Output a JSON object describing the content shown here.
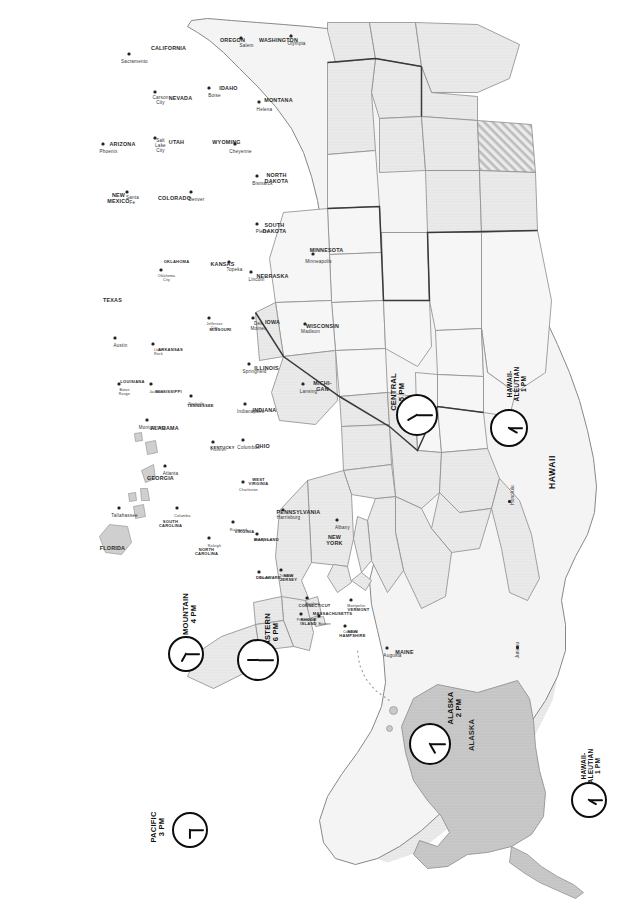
{
  "map": {
    "title": "United States Time Zone Map",
    "orientation": "rotated-90-clockwise",
    "background_color": "#ffffff",
    "zone_fill_color": "#e9e9e9",
    "no_dst_fill": "diagonal-hatch",
    "border_color": "#6b6b6b",
    "zone_divider_color": "#2f2f2f"
  },
  "zones": [
    {
      "name": "EASTERN",
      "time": "6 PM",
      "label": "EASTERN\n6 PM",
      "clock": "6:00"
    },
    {
      "name": "CENTRAL",
      "time": "5 PM",
      "label": "CENTRAL\n5 PM",
      "clock": "5:00"
    },
    {
      "name": "MOUNTAIN",
      "time": "4 PM",
      "label": "MOUNTAIN\n4 PM",
      "clock": "4:00"
    },
    {
      "name": "PACIFIC",
      "time": "3 PM",
      "label": "PACIFIC\n3 PM",
      "clock": "3:00"
    },
    {
      "name": "ALASKA",
      "time": "2 PM",
      "label": "ALASKA\n2 PM",
      "clock": "2:00"
    },
    {
      "name": "HAWAII-ALEUTIAN",
      "time": "1 PM",
      "label": "HAWAII-\nALEUTIAN\n1 PM",
      "clock": "1:00"
    },
    {
      "name": "HAWAII-ALEUTIAN",
      "time": "1 PM",
      "label": "HAWAII-\nALEUTIAN\n1 PM",
      "clock": "1:00"
    }
  ],
  "states": [
    {
      "name": "MAINE",
      "capital": "Augusta"
    },
    {
      "name": "NEW HAMPSHIRE",
      "capital": "Concord"
    },
    {
      "name": "VERMONT",
      "capital": "Montpelier"
    },
    {
      "name": "MASSACHUSETTS",
      "capital": "Boston"
    },
    {
      "name": "RHODE ISLAND",
      "capital": "Providence"
    },
    {
      "name": "CONNECTICUT",
      "capital": "Hartford"
    },
    {
      "name": "NEW YORK",
      "capital": "Albany"
    },
    {
      "name": "NEW JERSEY",
      "capital": "Trenton"
    },
    {
      "name": "PENNSYLVANIA",
      "capital": "Harrisburg"
    },
    {
      "name": "DELAWARE",
      "capital": "Dover"
    },
    {
      "name": "MARYLAND",
      "capital": "Annapolis"
    },
    {
      "name": "WEST VIRGINIA",
      "capital": "Charleston"
    },
    {
      "name": "VIRGINIA",
      "capital": "Richmond"
    },
    {
      "name": "NORTH CAROLINA",
      "capital": "Raleigh"
    },
    {
      "name": "SOUTH CAROLINA",
      "capital": "Columbia"
    },
    {
      "name": "GEORGIA",
      "capital": "Atlanta"
    },
    {
      "name": "FLORIDA",
      "capital": "Tallahassee"
    },
    {
      "name": "OHIO",
      "capital": "Columbus"
    },
    {
      "name": "KENTUCKY",
      "capital": "Frankfort"
    },
    {
      "name": "TENNESSEE",
      "capital": "Nashville"
    },
    {
      "name": "ALABAMA",
      "capital": "Montgomery"
    },
    {
      "name": "MISSISSIPPI",
      "capital": "Jackson"
    },
    {
      "name": "LOUISIANA",
      "capital": "Baton Rouge"
    },
    {
      "name": "ARKANSAS",
      "capital": "Little Rock"
    },
    {
      "name": "MISSOURI",
      "capital": "Jefferson City"
    },
    {
      "name": "ILLINOIS",
      "capital": "Springfield"
    },
    {
      "name": "INDIANA",
      "capital": "Indianapolis"
    },
    {
      "name": "MICHI-GAN",
      "capital": "Lansing"
    },
    {
      "name": "WISCONSIN",
      "capital": "Madison"
    },
    {
      "name": "MINNESOTA",
      "capital": "Minneapolis"
    },
    {
      "name": "IOWA",
      "capital": "Des Moines"
    },
    {
      "name": "NORTH DAKOTA",
      "capital": "Bismarck"
    },
    {
      "name": "SOUTH DAKOTA",
      "capital": "Pierre"
    },
    {
      "name": "NEBRASKA",
      "capital": "Lincoln"
    },
    {
      "name": "KANSAS",
      "capital": "Topeka"
    },
    {
      "name": "OKLAHOMA",
      "capital": "Oklahoma City"
    },
    {
      "name": "TEXAS",
      "capital": "Austin"
    },
    {
      "name": "NEW MEXICO",
      "capital": "Santa Fe"
    },
    {
      "name": "COLORADO",
      "capital": "Denver"
    },
    {
      "name": "WYOMING",
      "capital": "Cheyenne"
    },
    {
      "name": "MONTANA",
      "capital": "Helena"
    },
    {
      "name": "IDAHO",
      "capital": "Boise"
    },
    {
      "name": "UTAH",
      "capital": "Salt Lake City"
    },
    {
      "name": "ARIZONA",
      "capital": "Phoenix"
    },
    {
      "name": "NEVADA",
      "capital": "Carson City"
    },
    {
      "name": "CALIFORNIA",
      "capital": "Sacramento"
    },
    {
      "name": "OREGON",
      "capital": "Salem"
    },
    {
      "name": "WASHINGTON",
      "capital": "Olympia"
    },
    {
      "name": "ALASKA",
      "capital": "Juneau"
    },
    {
      "name": "HAWAII",
      "capital": "Honolulu"
    }
  ],
  "insets": {
    "alaska": {
      "name": "ALASKA",
      "capital": "Juneau",
      "zone": "ALASKA\n2 PM"
    },
    "hawaii": {
      "name": "HAWAII",
      "capital": "Honolulu",
      "zone": "HAWAII-\nALEUTIAN\n1 PM"
    },
    "aleutian": {
      "zone": "HAWAII-\nALEUTIAN\n1 PM"
    }
  }
}
